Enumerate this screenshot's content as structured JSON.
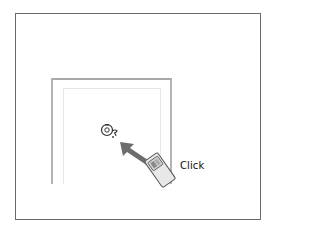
{
  "diagram": {
    "action_label": "Click",
    "elements": {
      "outer_frame": "figure-border",
      "window": "application-window",
      "cursor": "busy-cursor-icon",
      "arrow": "pointing-arrow",
      "device": "remote-control"
    },
    "colors": {
      "arrow": "#6d6d6d",
      "device_body": "#e6e6e6",
      "device_outline": "#555555",
      "frame": "#6a6a6a",
      "window_frame": "#b4b4b4"
    }
  }
}
